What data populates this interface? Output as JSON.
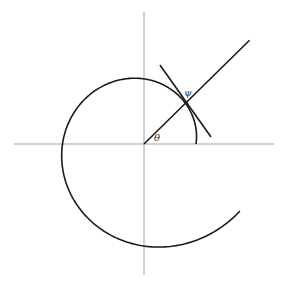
{
  "diagram": {
    "title": "",
    "labels": {
      "theta": "θ",
      "psi": "ψ"
    },
    "origin": {
      "x": 144,
      "y": 144
    },
    "axes": {
      "x_from": 14,
      "x_to": 274,
      "y_from": 12,
      "y_to": 275,
      "color": "#8a8a8a"
    },
    "spiral": {
      "type": "logarithmic",
      "r0": 52,
      "growth_b": 0.143,
      "theta_start_deg": 0,
      "theta_end_deg": 325,
      "direction": "counterclockwise",
      "color": "#1a1a1a"
    },
    "radial_line": {
      "angle_deg": 44.5,
      "length": 148,
      "color": "#1a1a1a"
    },
    "tangent_line": {
      "x1": 160,
      "y1": 65,
      "x2": 211,
      "y2": 137,
      "color": "#1a1a1a"
    },
    "theta_arc_note": "angle θ between positive x-axis and radial line",
    "psi_note": "angle ψ between radial line and tangent"
  }
}
